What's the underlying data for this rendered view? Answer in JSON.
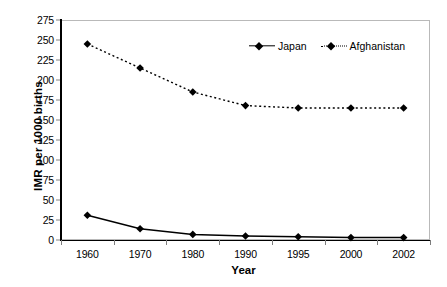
{
  "chart_data": {
    "type": "line",
    "title": "",
    "xlabel": "Year",
    "ylabel": "IMR per 1000 births",
    "categories": [
      "1960",
      "1970",
      "1980",
      "1990",
      "1995",
      "2000",
      "2002"
    ],
    "ylim": [
      0,
      275
    ],
    "yticks": [
      "275",
      "250",
      "225",
      "200",
      "175",
      "150",
      "125",
      "100",
      "75",
      "50",
      "25",
      "0"
    ],
    "ytick_values": [
      275,
      250,
      225,
      200,
      175,
      150,
      125,
      100,
      75,
      50,
      25,
      0
    ],
    "grid": false,
    "legend_position": "top-right",
    "series": [
      {
        "name": "Japan",
        "values": [
          31,
          14,
          7,
          5,
          4,
          3,
          3
        ],
        "line_style": "solid",
        "marker": "diamond",
        "color": "#000000"
      },
      {
        "name": "Afghanistan",
        "values": [
          245,
          215,
          185,
          168,
          165,
          165,
          165
        ],
        "line_style": "dotted",
        "marker": "diamond",
        "color": "#000000"
      }
    ]
  },
  "legend": {
    "japan_label": "Japan",
    "afghanistan_label": "Afghanistan"
  },
  "colors": {
    "series": "#000000",
    "frame": "#b9b9b9",
    "axis": "#000000",
    "tick": "#7d7d7d"
  }
}
